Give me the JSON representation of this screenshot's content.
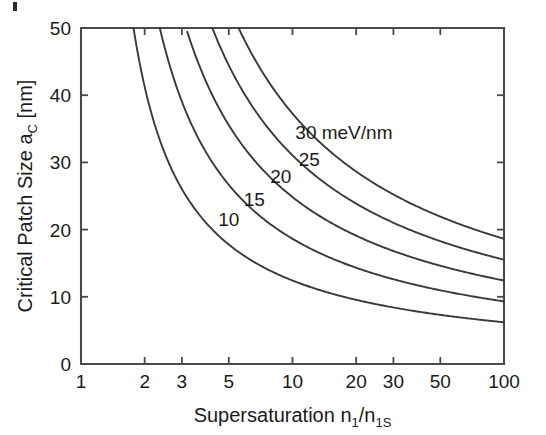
{
  "figure": {
    "background_color": "#ffffff",
    "axis_color": "#4a4a4a",
    "curve_color": "#3a3a3a",
    "text_color": "#1a1a1a"
  },
  "chart_data": {
    "type": "line",
    "title": "",
    "xlabel": "Supersaturation n1/n1S",
    "xlabel_parts": {
      "prefix": "Supersaturation n",
      "sub1": "1",
      "slash": "/n",
      "sub2": "1S"
    },
    "ylabel": "Critical Patch Size aC [nm]",
    "ylabel_parts": {
      "prefix": "Critical Patch Size a",
      "sub": "C",
      "suffix": " [nm]"
    },
    "xscale": "log",
    "yscale": "linear",
    "xlim": [
      1,
      100
    ],
    "ylim": [
      0,
      50
    ],
    "grid": false,
    "legend_position": "inline-curve-labels",
    "xticks": [
      1,
      2,
      3,
      5,
      10,
      20,
      30,
      50,
      100
    ],
    "xticklabels": [
      "1",
      "2",
      "3",
      "5",
      "10",
      "20",
      "30",
      "50",
      "100"
    ],
    "yticks": [
      0,
      10,
      20,
      30,
      40,
      50
    ],
    "yticklabels": [
      "0",
      "10",
      "20",
      "30",
      "40",
      "50"
    ],
    "series_units": "meV/nm",
    "formula": "a_c = C * gamma / ln(S)",
    "formula_constant": 2.86,
    "series": [
      {
        "name": "10",
        "gamma": 10,
        "label": "10",
        "label_x": 5.0,
        "label_y": 20.5,
        "x": [
          1.8,
          2,
          2.5,
          3,
          4,
          5,
          7,
          10,
          15,
          20,
          30,
          50,
          70,
          100
        ],
        "values": [
          50.0,
          41.3,
          31.2,
          26.0,
          20.6,
          17.8,
          14.7,
          12.4,
          10.6,
          9.5,
          8.4,
          7.3,
          6.7,
          6.2
        ]
      },
      {
        "name": "15",
        "gamma": 15,
        "label": "15",
        "label_x": 6.6,
        "label_y": 23.5,
        "x": [
          2.35,
          3,
          4,
          5,
          7,
          10,
          15,
          20,
          30,
          50,
          70,
          100
        ],
        "values": [
          50.0,
          39.0,
          30.9,
          26.7,
          22.0,
          18.6,
          15.8,
          14.3,
          12.6,
          11.0,
          10.1,
          9.3
        ]
      },
      {
        "name": "20",
        "gamma": 20,
        "label": "20",
        "label_x": 8.8,
        "label_y": 27.0,
        "x": [
          3.0,
          4,
          5,
          7,
          10,
          15,
          20,
          30,
          50,
          70,
          100
        ],
        "values": [
          50.0,
          41.2,
          35.5,
          29.4,
          24.8,
          21.1,
          19.1,
          16.8,
          14.6,
          13.5,
          12.4
        ]
      },
      {
        "name": "25",
        "gamma": 25,
        "label": "25",
        "label_x": 12.0,
        "label_y": 29.5,
        "x": [
          4.0,
          5,
          7,
          10,
          15,
          20,
          30,
          50,
          70,
          100
        ],
        "values": [
          50.0,
          44.4,
          36.7,
          31.0,
          26.4,
          23.9,
          21.0,
          18.3,
          16.8,
          15.5
        ]
      },
      {
        "name": "30",
        "gamma": 30,
        "label": "30 meV/nm",
        "label_x": 17.5,
        "label_y": 33.5,
        "x": [
          5.2,
          7,
          10,
          15,
          20,
          30,
          50,
          70,
          100
        ],
        "values": [
          50.0,
          44.1,
          37.3,
          31.7,
          28.6,
          25.2,
          21.9,
          20.2,
          18.6
        ]
      }
    ]
  }
}
